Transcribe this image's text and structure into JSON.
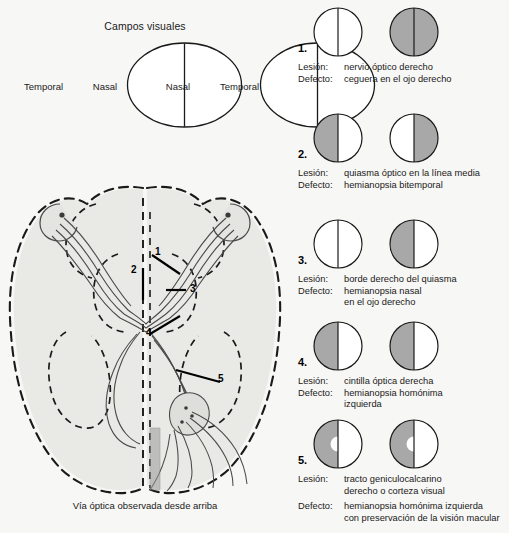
{
  "figure": {
    "title": "Campos visuales",
    "brain_caption": "Vía óptica observada desde arriba",
    "background_color": "#f7f7f5",
    "shade_color": "#a8a8a8",
    "line_color": "#1a1a1a"
  },
  "visual_fields": {
    "title": "Campos visuales",
    "left_eye": {
      "outer_label": "Temporal",
      "inner_label": "Nasal"
    },
    "right_eye": {
      "inner_label": "Nasal",
      "outer_label": "Temporal"
    }
  },
  "brain_diagram": {
    "caption": "Vía óptica observada desde arriba",
    "markers": [
      {
        "number": "1."
      },
      {
        "number": "2."
      },
      {
        "number": "3."
      },
      {
        "number": "4."
      },
      {
        "number": "5."
      }
    ],
    "marker_numbers": [
      "1",
      "2",
      "3",
      "4",
      "5"
    ]
  },
  "labels": {
    "lesion_key": "Lesión:",
    "defect_key": "Defecto:"
  },
  "cases": [
    {
      "number": "1.",
      "lesion": [
        "nervio óptico derecho"
      ],
      "defect": [
        "ceguera en el ojo derecho"
      ],
      "left_eye": {
        "left_half": "white",
        "right_half": "white",
        "macular_sparing": false
      },
      "right_eye": {
        "left_half": "shaded",
        "right_half": "shaded",
        "macular_sparing": false
      }
    },
    {
      "number": "2.",
      "lesion": [
        "quiasma óptico en la línea media"
      ],
      "defect": [
        "hemianopsia bitemporal"
      ],
      "left_eye": {
        "left_half": "shaded",
        "right_half": "white",
        "macular_sparing": false
      },
      "right_eye": {
        "left_half": "white",
        "right_half": "shaded",
        "macular_sparing": false
      }
    },
    {
      "number": "3.",
      "lesion": [
        "borde derecho del quiasma"
      ],
      "defect": [
        "hemianopsia nasal",
        "en el ojo derecho"
      ],
      "left_eye": {
        "left_half": "white",
        "right_half": "white",
        "macular_sparing": false
      },
      "right_eye": {
        "left_half": "shaded",
        "right_half": "white",
        "macular_sparing": false
      }
    },
    {
      "number": "4.",
      "lesion": [
        "cintilla óptica derecha"
      ],
      "defect": [
        "hemianopsia homónima",
        "izquierda"
      ],
      "left_eye": {
        "left_half": "shaded",
        "right_half": "white",
        "macular_sparing": false
      },
      "right_eye": {
        "left_half": "shaded",
        "right_half": "white",
        "macular_sparing": false
      }
    },
    {
      "number": "5.",
      "lesion": [
        "tracto geniculocalcarino",
        "derecho o corteza visual"
      ],
      "defect": [
        "hemianopsia homónima izquierda",
        "con preservación de la visión macular"
      ],
      "left_eye": {
        "left_half": "shaded",
        "right_half": "white",
        "macular_sparing": true
      },
      "right_eye": {
        "left_half": "shaded",
        "right_half": "white",
        "macular_sparing": true
      }
    }
  ]
}
